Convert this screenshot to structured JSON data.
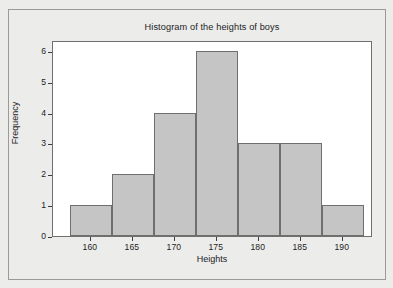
{
  "figure": {
    "title": "Histogram of the heights of boys",
    "background_color": "#ececeb",
    "plot_background_color": "#ffffff",
    "frame_color": "#6f6f6f",
    "outer_border_color": "#9a9a9a"
  },
  "chart_data": {
    "type": "bar",
    "title": "Histogram of the heights of boys",
    "xlabel": "Heights",
    "ylabel": "Frequency",
    "bin_edges": [
      157.5,
      162.5,
      167.5,
      172.5,
      177.5,
      182.5,
      187.5,
      192.5
    ],
    "categories": [
      "157.5-162.5",
      "162.5-167.5",
      "167.5-172.5",
      "172.5-177.5",
      "177.5-182.5",
      "182.5-187.5",
      "187.5-192.5"
    ],
    "values": [
      1,
      2,
      4,
      6,
      3,
      3,
      1
    ],
    "bar_fill_color": "#c5c5c5",
    "bar_edge_color": "#6f6f6f",
    "xlim": [
      155.5,
      193.6
    ],
    "ylim": [
      0,
      6.35
    ],
    "xticks": [
      160,
      165,
      170,
      175,
      180,
      185,
      190
    ],
    "xtick_labels": [
      "160",
      "165",
      "170",
      "175",
      "180",
      "185",
      "190"
    ],
    "yticks": [
      0,
      1,
      2,
      3,
      4,
      5,
      6
    ],
    "ytick_labels": [
      "0",
      "1",
      "2",
      "3",
      "4",
      "5",
      "6"
    ],
    "grid": false,
    "legend": false
  }
}
